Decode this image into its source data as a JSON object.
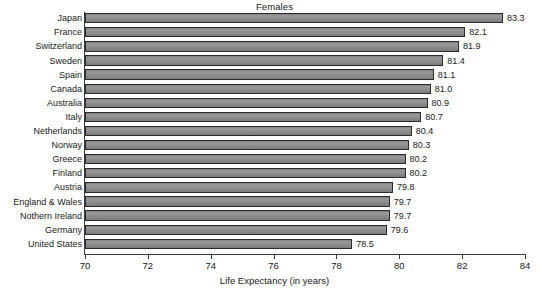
{
  "chart_data": {
    "type": "bar",
    "orientation": "horizontal",
    "title": "Females",
    "xlabel": "Life Expectancy (in years)",
    "ylabel": "",
    "xlim": [
      70,
      84
    ],
    "xticks": [
      70,
      72,
      74,
      76,
      78,
      80,
      82,
      84
    ],
    "grid": false,
    "legend": null,
    "categories": [
      "Japan",
      "France",
      "Switzerland",
      "Sweden",
      "Spain",
      "Canada",
      "Australia",
      "Italy",
      "Netherlands",
      "Norway",
      "Greece",
      "Finland",
      "Austria",
      "England & Wales",
      "Nothern Ireland",
      "Germany",
      "United States"
    ],
    "values": [
      83.3,
      82.1,
      81.9,
      81.4,
      81.1,
      81.0,
      80.9,
      80.7,
      80.4,
      80.3,
      80.2,
      80.2,
      79.8,
      79.7,
      79.7,
      79.6,
      78.5
    ],
    "value_labels": [
      "83.3",
      "82.1",
      "81.9",
      "81.4",
      "81.1",
      "81.0",
      "80.9",
      "80.7",
      "80.4",
      "80.3",
      "80.2",
      "80.2",
      "79.8",
      "79.7",
      "79.7",
      "79.6",
      "78.5"
    ],
    "bar_color": "#8d8d8d",
    "bar_edge_color": "#2b2b2b",
    "axis_color": "#3a3a3a",
    "text_color": "#1a1a1a",
    "background": "#ffffff"
  }
}
